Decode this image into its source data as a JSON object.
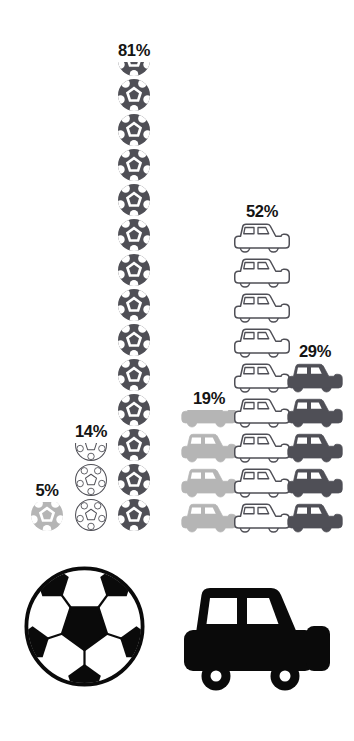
{
  "page": {
    "background": "#ffffff"
  },
  "colors": {
    "dark": "#4f4f56",
    "light": "#b5b5b5",
    "outline": "#4f4f56",
    "label_text": "#141414",
    "legend_black": "#0a0a0a",
    "white": "#ffffff"
  },
  "chart_data": {
    "type": "pictogram",
    "grid": false,
    "legend_position": "bottom",
    "groups": [
      {
        "name": "soccer-balls",
        "icon": "soccer-ball",
        "columns": [
          {
            "label": "5%",
            "value": 5,
            "style": "light",
            "full_icons": 0,
            "partial_fraction": 0.88
          },
          {
            "label": "14%",
            "value": 14,
            "style": "outline",
            "full_icons": 2,
            "partial_fraction": 0.55
          },
          {
            "label": "81%",
            "value": 81,
            "style": "dark",
            "full_icons": 13,
            "partial_fraction": 0.45
          }
        ]
      },
      {
        "name": "cars",
        "icon": "car",
        "columns": [
          {
            "label": "19%",
            "value": 19,
            "style": "light",
            "full_icons": 3,
            "partial_fraction": 0.6
          },
          {
            "label": "52%",
            "value": 52,
            "style": "outline",
            "full_icons": 9,
            "partial_fraction": 0
          },
          {
            "label": "29%",
            "value": 29,
            "style": "dark",
            "full_icons": 5,
            "partial_fraction": 0
          }
        ]
      }
    ],
    "legend": [
      {
        "icon": "soccer-ball"
      },
      {
        "icon": "car"
      }
    ]
  }
}
